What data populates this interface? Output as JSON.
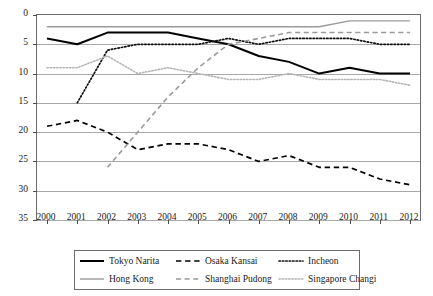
{
  "chart_data": {
    "type": "line",
    "title": "",
    "xlabel": "",
    "ylabel": "",
    "x": [
      2000,
      2001,
      2002,
      2003,
      2004,
      2005,
      2006,
      2007,
      2008,
      2009,
      2010,
      2011,
      2012
    ],
    "categories": [
      "2000",
      "2001",
      "2002",
      "2003",
      "2004",
      "2005",
      "2006",
      "2007",
      "2008",
      "2009",
      "2010",
      "2011",
      "2012"
    ],
    "ylim": [
      0,
      35
    ],
    "y_inverted": true,
    "yticks": [
      0,
      5,
      10,
      15,
      20,
      25,
      30,
      35
    ],
    "ytick_labels": [
      "0",
      "5",
      "10",
      "15",
      "20",
      "25",
      "30",
      "35"
    ],
    "grid": "horizontal",
    "legend_position": "bottom",
    "series": [
      {
        "name": "Tokyo Narita",
        "style": "solid",
        "color": "#000000",
        "width": 2.0,
        "x": [
          2000,
          2001,
          2002,
          2003,
          2004,
          2005,
          2006,
          2007,
          2008,
          2009,
          2010,
          2011,
          2012
        ],
        "values": [
          4,
          5,
          3,
          3,
          3,
          4,
          5,
          7,
          8,
          10,
          9,
          10,
          10
        ]
      },
      {
        "name": "Osaka Kansai",
        "style": "dashed",
        "color": "#000000",
        "width": 1.7,
        "x": [
          2000,
          2001,
          2002,
          2003,
          2004,
          2005,
          2006,
          2007,
          2008,
          2009,
          2010,
          2011,
          2012
        ],
        "values": [
          19,
          18,
          20,
          23,
          22,
          22,
          23,
          25,
          24,
          26,
          26,
          28,
          29
        ]
      },
      {
        "name": "Incheon",
        "style": "dotted",
        "color": "#111111",
        "width": 1.7,
        "x": [
          2001,
          2002,
          2003,
          2004,
          2005,
          2006,
          2007,
          2008,
          2009,
          2010,
          2011,
          2012
        ],
        "values": [
          15,
          6,
          5,
          5,
          5,
          4,
          5,
          4,
          4,
          4,
          5,
          5
        ]
      },
      {
        "name": "Hong Kong",
        "style": "solid",
        "color": "#9a9a9a",
        "width": 1.4,
        "x": [
          2000,
          2001,
          2002,
          2003,
          2004,
          2005,
          2006,
          2007,
          2008,
          2009,
          2010,
          2011,
          2012
        ],
        "values": [
          2,
          2,
          2,
          2,
          2,
          2,
          2,
          2,
          2,
          2,
          1,
          1,
          1
        ]
      },
      {
        "name": "Shanghai Pudong",
        "style": "dashed",
        "color": "#9a9a9a",
        "width": 1.6,
        "x": [
          2002,
          2003,
          2004,
          2005,
          2006,
          2007,
          2008,
          2009,
          2010,
          2011,
          2012
        ],
        "values": [
          26,
          20,
          14,
          9,
          5,
          4,
          3,
          3,
          3,
          3,
          3
        ]
      },
      {
        "name": "Singapore Changi",
        "style": "dotted",
        "color": "#b5b5b5",
        "width": 1.6,
        "x": [
          2000,
          2001,
          2002,
          2003,
          2004,
          2005,
          2006,
          2007,
          2008,
          2009,
          2010,
          2011,
          2012
        ],
        "values": [
          9,
          9,
          7,
          10,
          9,
          10,
          11,
          11,
          10,
          11,
          11,
          11,
          12
        ]
      }
    ]
  },
  "legend": {
    "items": [
      {
        "label": "Tokyo Narita",
        "series": 0
      },
      {
        "label": "Osaka Kansai",
        "series": 1
      },
      {
        "label": "Incheon",
        "series": 2
      },
      {
        "label": "Hong Kong",
        "series": 3
      },
      {
        "label": "Shanghai Pudong",
        "series": 4
      },
      {
        "label": "Singapore Changi",
        "series": 5
      }
    ]
  }
}
